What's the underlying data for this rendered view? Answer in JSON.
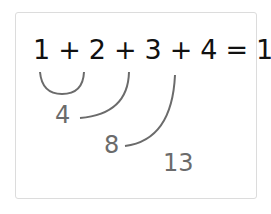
{
  "diagram": {
    "equation": "1 + 2 + 3 + 4 = 10",
    "terms": [
      "1",
      "2",
      "3",
      "4"
    ],
    "result": "10",
    "running_sums": [
      {
        "label": "4",
        "description": "1 + 2 grouped (arc), then +? shown as 4"
      },
      {
        "label": "8",
        "description": "running sum after adding 3"
      },
      {
        "label": "13",
        "description": "running sum after adding 4"
      }
    ],
    "colors": {
      "equation": "#111111",
      "annotation": "#6b6b6b",
      "card_border": "#dcdcdc"
    }
  }
}
